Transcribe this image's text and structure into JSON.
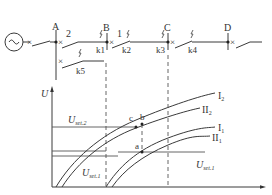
{
  "diagram": {
    "buses": [
      {
        "name": "A",
        "x": 56
      },
      {
        "name": "B",
        "x": 107
      },
      {
        "name": "C",
        "x": 168
      },
      {
        "name": "D",
        "x": 228
      }
    ],
    "line_labels": {
      "line2": "2",
      "line1": "1"
    },
    "faults": [
      "k1",
      "k2",
      "k3",
      "k4",
      "k5"
    ],
    "generator_symbol": "~"
  },
  "chart": {
    "y_axis_label": "U",
    "levels": {
      "u_set2_main": "U",
      "u_set2_sub": "set.2",
      "u_set1_left_main": "U",
      "u_set1_left_sub": "set.1",
      "u_set1_right_main": "U",
      "u_set1_right_sub": "set.1"
    },
    "points": {
      "a": "a",
      "b": "b",
      "c": "c"
    },
    "curves": [
      {
        "label_main": "I",
        "label_sub": "2"
      },
      {
        "label_main": "II",
        "label_sub": "2"
      },
      {
        "label_main": "I",
        "label_sub": "1"
      },
      {
        "label_main": "II",
        "label_sub": "1"
      }
    ]
  },
  "colors": {
    "stroke": "#3a3a3a",
    "background": "#ffffff"
  }
}
